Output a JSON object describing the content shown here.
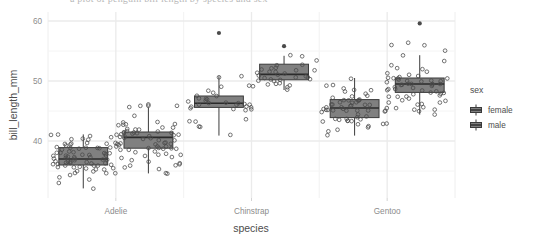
{
  "figure": {
    "background_color": "#ffffff",
    "panel_background": "#ffffff",
    "grid_major_color": "#ebebeb",
    "grid_minor_color": "#f4f4f4",
    "box_fill": "#808080",
    "box_stroke": "#3b3b3b",
    "point_color": "#4a4a4a",
    "text_color": "#4d4d4d",
    "tick_color": "#8c8c8c",
    "top_clipped_text": "a plot of penguin bill length by species and sex"
  },
  "axes": {
    "y_title": "bill_length_mm",
    "x_title": "species",
    "y_ticks": [
      "60",
      "50",
      "40"
    ],
    "y_tick_values": [
      60,
      50,
      40
    ],
    "y_minor_values": [
      55,
      45,
      35
    ],
    "x_ticks": [
      "Adelie",
      "Chinstrap",
      "Gentoo"
    ]
  },
  "legend": {
    "title": "sex",
    "items": [
      {
        "label": "female",
        "key": "boxplot-key"
      },
      {
        "label": "male",
        "key": "boxplot-key"
      }
    ]
  },
  "chart_data": {
    "type": "boxplot",
    "title": "",
    "xlabel": "species",
    "ylabel": "bill_length_mm",
    "ylim": [
      30.5,
      61.5
    ],
    "grid": true,
    "legend_position": "right",
    "categories": [
      "Adelie",
      "Chinstrap",
      "Gentoo"
    ],
    "groupby": "sex",
    "series": [
      {
        "name": "female",
        "boxes": [
          {
            "category": "Adelie",
            "min": 32.1,
            "q1": 36.0,
            "median": 37.0,
            "q3": 38.9,
            "max": 41.1,
            "outliers": [],
            "n": 73,
            "points": [
              32.1,
              33.1,
              33.5,
              34.0,
              34.4,
              34.5,
              34.6,
              34.6,
              35.0,
              35.0,
              35.2,
              35.3,
              35.5,
              35.5,
              35.6,
              35.7,
              35.7,
              35.9,
              35.9,
              36.0,
              36.0,
              36.2,
              36.2,
              36.2,
              36.3,
              36.4,
              36.4,
              36.5,
              36.5,
              36.6,
              36.7,
              36.7,
              36.8,
              36.9,
              37.0,
              37.0,
              37.2,
              37.2,
              37.3,
              37.3,
              37.5,
              37.6,
              37.6,
              37.7,
              37.8,
              37.8,
              37.9,
              37.9,
              38.1,
              38.1,
              38.2,
              38.3,
              38.6,
              38.6,
              38.8,
              38.8,
              38.9,
              38.9,
              39.0,
              39.0,
              39.2,
              39.5,
              39.5,
              39.6,
              39.6,
              39.7,
              40.2,
              40.2,
              40.3,
              40.6,
              40.8,
              40.9,
              41.1
            ]
          },
          {
            "category": "Chinstrap",
            "min": 40.9,
            "q1": 45.6,
            "median": 46.3,
            "q3": 47.5,
            "max": 50.8,
            "outliers": [
              58.0
            ],
            "n": 34,
            "points": [
              40.9,
              42.4,
              42.5,
              43.2,
              43.2,
              43.5,
              45.2,
              45.2,
              45.4,
              45.5,
              45.6,
              45.7,
              45.7,
              46.0,
              46.1,
              46.1,
              46.2,
              46.4,
              46.4,
              46.5,
              46.6,
              46.7,
              46.9,
              47.0,
              47.0,
              47.5,
              47.6,
              48.1,
              48.5,
              49.0,
              49.2,
              50.5,
              50.8,
              58.0
            ]
          },
          {
            "category": "Gentoo",
            "min": 40.9,
            "q1": 43.9,
            "median": 45.5,
            "q3": 46.9,
            "max": 50.5,
            "outliers": [],
            "n": 58,
            "points": [
              40.9,
              41.7,
              42.0,
              42.3,
              42.6,
              42.7,
              42.8,
              42.9,
              43.2,
              43.3,
              43.3,
              43.4,
              43.5,
              43.5,
              43.6,
              43.8,
              44.0,
              44.0,
              44.9,
              44.9,
              45.0,
              45.1,
              45.1,
              45.2,
              45.2,
              45.2,
              45.3,
              45.4,
              45.5,
              45.5,
              45.5,
              45.7,
              45.8,
              46.1,
              46.2,
              46.2,
              46.4,
              46.5,
              46.5,
              46.6,
              46.7,
              46.8,
              46.8,
              46.9,
              47.2,
              47.3,
              47.5,
              48.2,
              48.4,
              48.5,
              48.7,
              49.1,
              49.3,
              50.5,
              45.9,
              44.5,
              46.0,
              47.8
            ]
          }
        ]
      },
      {
        "name": "male",
        "boxes": [
          {
            "category": "Adelie",
            "min": 34.6,
            "q1": 38.8,
            "median": 40.6,
            "q3": 41.5,
            "max": 45.6,
            "outliers": [],
            "n": 73,
            "points": [
              34.6,
              34.6,
              35.7,
              36.0,
              36.2,
              36.7,
              37.2,
              37.3,
              37.6,
              37.7,
              37.8,
              37.9,
              38.1,
              38.2,
              38.5,
              38.6,
              38.6,
              38.7,
              38.8,
              38.8,
              38.9,
              39.0,
              39.1,
              39.2,
              39.2,
              39.3,
              39.5,
              39.6,
              39.6,
              39.7,
              39.7,
              39.8,
              40.1,
              40.2,
              40.3,
              40.6,
              40.6,
              40.6,
              40.7,
              40.8,
              40.9,
              41.0,
              41.1,
              41.1,
              41.1,
              41.3,
              41.3,
              41.4,
              41.4,
              41.5,
              41.5,
              41.6,
              41.8,
              42.0,
              42.1,
              42.2,
              42.3,
              42.5,
              42.7,
              42.8,
              42.9,
              43.1,
              43.2,
              44.1,
              45.6,
              45.8,
              45.8,
              45.9,
              46.0,
              35.3,
              35.9,
              36.2,
              36.5
            ]
          },
          {
            "category": "Chinstrap",
            "min": 48.5,
            "q1": 50.2,
            "median": 51.1,
            "q3": 52.8,
            "max": 54.2,
            "outliers": [
              55.8
            ],
            "n": 34,
            "points": [
              48.5,
              49.0,
              49.2,
              49.3,
              49.5,
              49.6,
              49.7,
              50.0,
              50.1,
              50.2,
              50.2,
              50.3,
              50.5,
              50.6,
              50.7,
              50.8,
              50.8,
              51.0,
              51.3,
              51.3,
              51.4,
              51.5,
              51.7,
              51.9,
              52.0,
              52.0,
              52.2,
              52.7,
              52.8,
              53.5,
              54.2,
              54.2,
              55.8,
              55.8
            ]
          },
          {
            "category": "Gentoo",
            "min": 44.4,
            "q1": 48.1,
            "median": 49.5,
            "q3": 50.5,
            "max": 54.3,
            "outliers": [
              59.6
            ],
            "n": 61,
            "points": [
              44.4,
              44.9,
              45.1,
              45.2,
              45.5,
              45.5,
              46.1,
              46.2,
              46.4,
              46.5,
              46.6,
              46.8,
              47.2,
              47.3,
              47.4,
              47.5,
              47.6,
              47.7,
              47.8,
              48.1,
              48.2,
              48.4,
              48.4,
              48.5,
              48.6,
              48.7,
              48.8,
              49.0,
              49.1,
              49.2,
              49.3,
              49.4,
              49.5,
              49.5,
              49.6,
              49.6,
              49.8,
              49.9,
              50.0,
              50.0,
              50.1,
              50.2,
              50.4,
              50.4,
              50.5,
              50.5,
              50.7,
              50.8,
              51.1,
              51.3,
              51.5,
              52.1,
              52.2,
              52.5,
              53.4,
              54.3,
              55.1,
              55.9,
              55.9,
              56.3,
              59.6
            ]
          }
        ]
      }
    ]
  }
}
